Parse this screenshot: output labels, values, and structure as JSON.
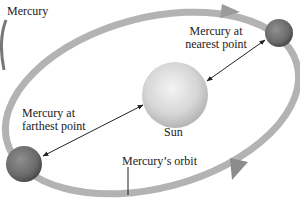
{
  "title": "Mercury",
  "labels": {
    "nearest": [
      "Mercury at",
      "nearest point"
    ],
    "farthest": [
      "Mercury at",
      "farthest point"
    ],
    "sun": "Sun",
    "orbit": "Mercury’s orbit"
  },
  "colors": {
    "orbit": "#a9a9a9",
    "sun_center": "#f2f2f2",
    "sun_edge": "#b8b8b8",
    "planet_center": "#8a8a8a",
    "planet_edge": "#4a4a4a",
    "text": "#222222"
  }
}
